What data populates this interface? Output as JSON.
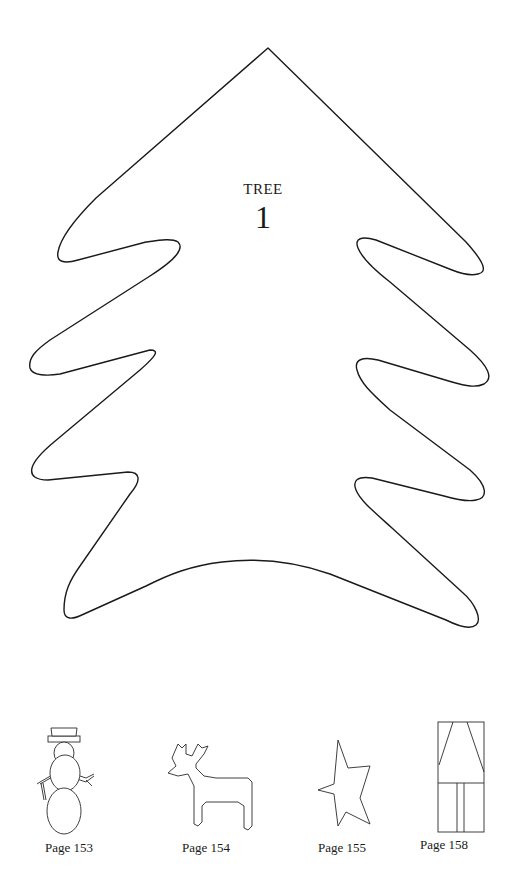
{
  "pattern": {
    "title": "TREE",
    "number": "1",
    "outline_color": "#1a1a1a",
    "background_color": "#ffffff"
  },
  "thumbnails": [
    {
      "shape": "snowman",
      "label": "Page 153"
    },
    {
      "shape": "reindeer",
      "label": "Page 154"
    },
    {
      "shape": "star",
      "label": "Page 155"
    },
    {
      "shape": "house",
      "label": "Page 158"
    }
  ]
}
